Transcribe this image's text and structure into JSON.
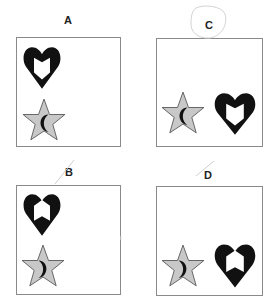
{
  "figure": {
    "type": "multiple-choice visual puzzle",
    "panels": [
      {
        "id": "A",
        "label": "A",
        "layout": "vertical",
        "heart": {
          "position": "top-left",
          "cutout": "shield-notch-top"
        },
        "star": {
          "position": "bottom-left",
          "crescent": "opening-right"
        }
      },
      {
        "id": "B",
        "label": "B",
        "layout": "vertical",
        "heart": {
          "position": "top-left",
          "cutout": "banner-notch-bottom"
        },
        "star": {
          "position": "bottom-left",
          "crescent": "opening-left"
        }
      },
      {
        "id": "C",
        "label": "C",
        "layout": "horizontal",
        "heart": {
          "position": "bottom-right",
          "cutout": "shield-notch-top"
        },
        "star": {
          "position": "bottom-left",
          "crescent": "opening-right"
        },
        "annotation": "circled"
      },
      {
        "id": "D",
        "label": "D",
        "layout": "horizontal",
        "heart": {
          "position": "bottom-right",
          "cutout": "banner-notch-bottom"
        },
        "star": {
          "position": "bottom-left",
          "crescent": "opening-left"
        }
      }
    ],
    "colors": {
      "heart": "#111111",
      "star_fill": "#c8c8c8",
      "star_stroke": "#555555",
      "crescent": "#111111",
      "panel_border": "#8a8a8a",
      "pencil_mark": "#cfcfcf"
    },
    "icons": {
      "heart": "heart-icon",
      "star": "star-icon",
      "crescent": "crescent-moon-icon"
    }
  }
}
